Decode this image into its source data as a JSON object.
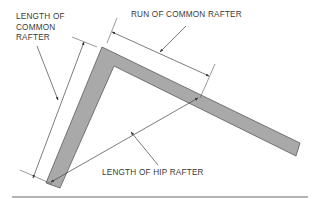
{
  "diagram": {
    "labels": {
      "common_rafter_length": {
        "line1": "LENGTH OF",
        "line2": "COMMON",
        "line3": "RAFTER"
      },
      "common_rafter_run": "RUN OF COMMON RAFTER",
      "hip_rafter_length": "LENGTH OF HIP RAFTER"
    },
    "colors": {
      "rafter_fill": "#a9a9a9",
      "rafter_stroke": "#5a5a5a",
      "line": "#4a4a4a",
      "text": "#3a3a3a",
      "baseline": "#6a6a6a"
    }
  }
}
